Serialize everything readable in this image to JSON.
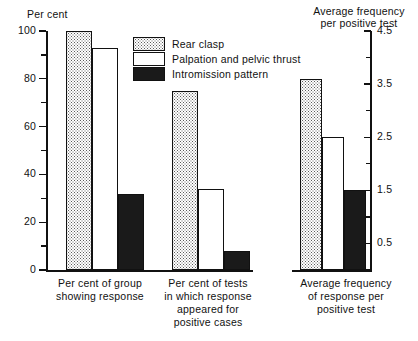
{
  "chart_data": {
    "type": "bar",
    "title": "",
    "grid": false,
    "legend_position": "top-center-inside",
    "panels": [
      {
        "name": "percent-panel",
        "axis": "left",
        "ylabel": "Per cent",
        "ylim": [
          0,
          100
        ],
        "yticks": [
          0,
          20,
          40,
          60,
          80,
          100
        ],
        "ytick_labels": [
          "0",
          "20",
          "40",
          "60",
          "80",
          "100"
        ],
        "minor_tick_step": 10,
        "categories": [
          "Per cent of group\nshowing response",
          "Per cent of tests\nin which response\nappeared for\npositive cases"
        ],
        "series": [
          {
            "name": "Rear clasp",
            "style": "stipple",
            "values": [
              100,
              75
            ]
          },
          {
            "name": "Palpation and pelvic thrust",
            "style": "white",
            "values": [
              93,
              34
            ]
          },
          {
            "name": "Intromission pattern",
            "style": "black",
            "values": [
              32,
              8
            ]
          }
        ]
      },
      {
        "name": "frequency-panel",
        "axis": "right",
        "ylabel": "Average frequency\nper positive test",
        "ylim": [
          0,
          4.5
        ],
        "yticks": [
          0.5,
          1.5,
          2.5,
          3.5,
          4.5
        ],
        "ytick_labels": [
          "0.5",
          "1.5",
          "2.5",
          "3.5",
          "4.5"
        ],
        "minor_tick_step": 0.5,
        "categories": [
          "Average frequency\nof response per\npositive test"
        ],
        "series": [
          {
            "name": "Rear clasp",
            "style": "stipple",
            "values": [
              3.6
            ]
          },
          {
            "name": "Palpation and pelvic thrust",
            "style": "white",
            "values": [
              2.5
            ]
          },
          {
            "name": "Intromission pattern",
            "style": "black",
            "values": [
              1.5
            ]
          }
        ]
      }
    ],
    "legend": [
      {
        "label": "Rear clasp",
        "style": "stipple"
      },
      {
        "label": "Palpation and pelvic thrust",
        "style": "white"
      },
      {
        "label": "Intromission pattern",
        "style": "black"
      }
    ]
  },
  "axes": {
    "left": {
      "title": "Per cent",
      "tick_labels": [
        "100",
        "80",
        "60",
        "40",
        "20",
        "0"
      ]
    },
    "right": {
      "title": "Average frequency\nper positive test",
      "tick_labels": [
        "4.5",
        "3.5",
        "2.5",
        "1.5",
        "0.5"
      ]
    }
  },
  "categories": {
    "group_0": "Per cent of group\nshowing response",
    "group_1": "Per cent of tests\nin which response\nappeared for\npositive cases",
    "group_2": "Average frequency\nof response per\npositive test"
  },
  "legend": {
    "items": [
      {
        "label": "Rear clasp"
      },
      {
        "label": "Palpation and pelvic thrust"
      },
      {
        "label": "Intromission pattern"
      }
    ]
  },
  "colors": {
    "ink": "#111111",
    "stipple_dot": "#5a5a5a",
    "fill_black": "#1a1a1a",
    "fill_white": "#ffffff",
    "background": "#ffffff"
  }
}
